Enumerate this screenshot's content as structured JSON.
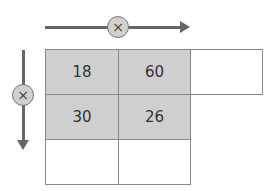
{
  "operators": {
    "horizontal": "×",
    "vertical": "×"
  },
  "colors": {
    "shaded": "#cfcfcf",
    "arrow": "#666666"
  },
  "grid": {
    "rows": [
      [
        "18",
        "60",
        ""
      ],
      [
        "30",
        "26"
      ],
      [
        "",
        ""
      ]
    ]
  }
}
